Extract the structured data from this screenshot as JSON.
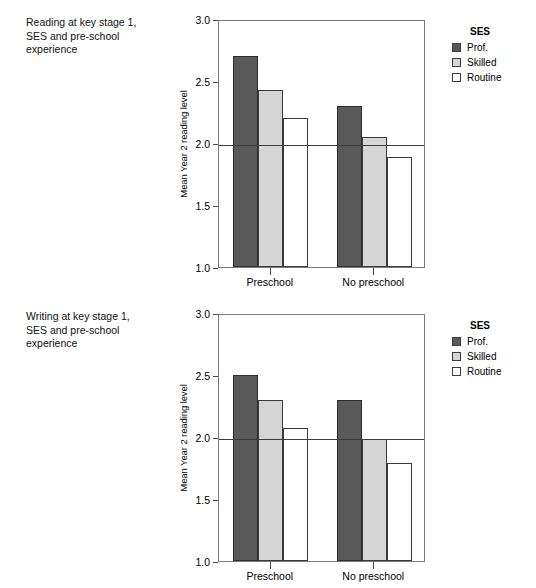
{
  "figure": {
    "background_color": "#ffffff",
    "panels": [
      {
        "id": "reading",
        "caption": "Reading at key stage 1,\nSES and pre-school\nexperience",
        "legend": {
          "title": "SES",
          "entries": [
            {
              "label": "Prof.",
              "color": "#595959",
              "swatch": "prof"
            },
            {
              "label": "Skilled",
              "color": "#d5d5d5",
              "swatch": "skilled"
            },
            {
              "label": "Routine",
              "color": "#ffffff",
              "swatch": "routine"
            }
          ]
        }
      },
      {
        "id": "writing",
        "caption": "Writing at key stage 1,\nSES and pre-school\nexperience",
        "legend": {
          "title": "SES",
          "entries": [
            {
              "label": "Prof.",
              "color": "#595959",
              "swatch": "prof"
            },
            {
              "label": "Skilled",
              "color": "#d5d5d5",
              "swatch": "skilled"
            },
            {
              "label": "Routine",
              "color": "#ffffff",
              "swatch": "routine"
            }
          ]
        }
      }
    ]
  },
  "chart_data": [
    {
      "type": "bar",
      "id": "reading",
      "title": "Reading at key stage 1, SES and pre-school experience",
      "xlabel": "",
      "ylabel": "Mean Year 2 reading level",
      "categories": [
        "Preschool",
        "No preschool"
      ],
      "series": [
        {
          "name": "Prof.",
          "values": [
            2.7,
            2.3
          ],
          "color": "#595959"
        },
        {
          "name": "Skilled",
          "values": [
            2.43,
            2.05
          ],
          "color": "#d5d5d5"
        },
        {
          "name": "Routine",
          "values": [
            2.2,
            1.89
          ],
          "color": "#ffffff"
        }
      ],
      "ylim": [
        1.0,
        3.0
      ],
      "yticks": [
        1.0,
        1.5,
        2.0,
        2.5,
        3.0
      ],
      "ytick_labels": [
        "1.0",
        "1.5",
        "2.0",
        "2.5",
        "3.0"
      ],
      "reference_line": 2.0,
      "grid": false,
      "legend_position": "right",
      "legend_title": "SES"
    },
    {
      "type": "bar",
      "id": "writing",
      "title": "Writing at key stage 1, SES and pre-school experience",
      "xlabel": "",
      "ylabel": "Mean Year 2 reading level",
      "categories": [
        "Preschool",
        "No preschool"
      ],
      "series": [
        {
          "name": "Prof.",
          "values": [
            2.5,
            2.3
          ],
          "color": "#595959"
        },
        {
          "name": "Skilled",
          "values": [
            2.3,
            1.98
          ],
          "color": "#d5d5d5"
        },
        {
          "name": "Routine",
          "values": [
            2.07,
            1.79
          ],
          "color": "#ffffff"
        }
      ],
      "ylim": [
        1.0,
        3.0
      ],
      "yticks": [
        1.0,
        1.5,
        2.0,
        2.5,
        3.0
      ],
      "ytick_labels": [
        "1.0",
        "1.5",
        "2.0",
        "2.5",
        "3.0"
      ],
      "reference_line": 2.0,
      "grid": false,
      "legend_position": "right",
      "legend_title": "SES"
    }
  ]
}
